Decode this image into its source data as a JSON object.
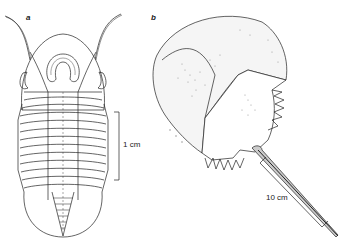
{
  "figure": {
    "panels": [
      {
        "id": "a",
        "label": "a",
        "subject": "trilobite",
        "scale_bar": "1 cm"
      },
      {
        "id": "b",
        "label": "b",
        "subject": "horseshoe crab",
        "scale_bar": "10 cm"
      }
    ]
  },
  "colors": {
    "line": "#222222",
    "background": "#ffffff",
    "stipple": "#9a9a9a"
  }
}
